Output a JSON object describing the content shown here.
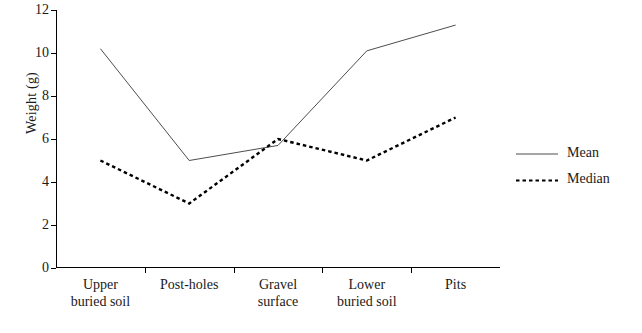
{
  "chart_data": {
    "type": "line",
    "title": "",
    "xlabel": "",
    "ylabel": "Weight (g)",
    "categories": [
      "Upper buried soil",
      "Post-holes",
      "Gravel surface",
      "Lower buried soil",
      "Pits"
    ],
    "category_lines": [
      [
        "Upper",
        "buried soil"
      ],
      [
        "Post-holes",
        ""
      ],
      [
        "Gravel",
        "surface"
      ],
      [
        "Lower",
        "buried soil"
      ],
      [
        "Pits",
        ""
      ]
    ],
    "ylim": [
      0,
      12
    ],
    "yticks": [
      0,
      2,
      4,
      6,
      8,
      10,
      12
    ],
    "grid": false,
    "legend_position": "right",
    "series": [
      {
        "name": "Mean",
        "style": "solid",
        "color": "#4d4d4d",
        "values": [
          10.2,
          5.0,
          5.7,
          10.1,
          11.3
        ]
      },
      {
        "name": "Median",
        "style": "dotted",
        "color": "#000000",
        "values": [
          5.0,
          3.0,
          6.0,
          5.0,
          7.0
        ]
      }
    ]
  },
  "legend": {
    "items": [
      {
        "label": "Mean"
      },
      {
        "label": "Median"
      }
    ]
  }
}
